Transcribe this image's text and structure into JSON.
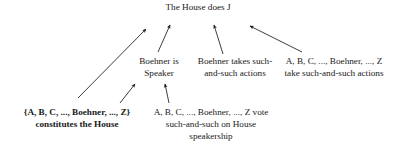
{
  "diagram": {
    "type": "grounding-diagram",
    "background_color": "#ffffff",
    "text_color": "#1a1a1a",
    "nodes": {
      "top": {
        "label": "The House does J",
        "level": "top",
        "bold": false
      },
      "speaker": {
        "label": "Boehner is\nSpeaker",
        "level": "middle",
        "bold": false
      },
      "actions": {
        "label": "Boehner takes such-\nand-such actions",
        "level": "middle",
        "bold": false
      },
      "collective_actions": {
        "label": "A, B, C, ..., Boehner, ..., Z\ntake such-and-such actions",
        "level": "middle",
        "bold": false
      },
      "constitutes": {
        "label": "{A, B, C, ..., Boehner, ..., Z}\nconstitutes the House",
        "level": "bottom",
        "bold": true
      },
      "vote": {
        "label": "A, B, C, ..., Boehner, ..., Z vote\nsuch-and-such on House\nspeakership",
        "level": "bottom",
        "bold": false
      }
    },
    "arrows": [
      {
        "name": "constitutes-to-top",
        "from": "constitutes",
        "to": "top",
        "x1": 78,
        "y1": 98,
        "x2": 146,
        "y2": 29
      },
      {
        "name": "speaker-to-top",
        "from": "speaker",
        "to": "top",
        "x1": 158,
        "y1": 52,
        "x2": 170,
        "y2": 25
      },
      {
        "name": "actions-to-top",
        "from": "actions",
        "to": "top",
        "x1": 223,
        "y1": 54,
        "x2": 214,
        "y2": 25
      },
      {
        "name": "collective-actions-to-top",
        "from": "collective_actions",
        "to": "top",
        "x1": 302,
        "y1": 52,
        "x2": 250,
        "y2": 26
      },
      {
        "name": "constitutes-to-speaker",
        "from": "constitutes",
        "to": "speaker",
        "x1": 120,
        "y1": 103,
        "x2": 135,
        "y2": 84
      },
      {
        "name": "vote-to-speaker",
        "from": "vote",
        "to": "speaker",
        "x1": 169,
        "y1": 103,
        "x2": 165,
        "y2": 84
      }
    ]
  }
}
